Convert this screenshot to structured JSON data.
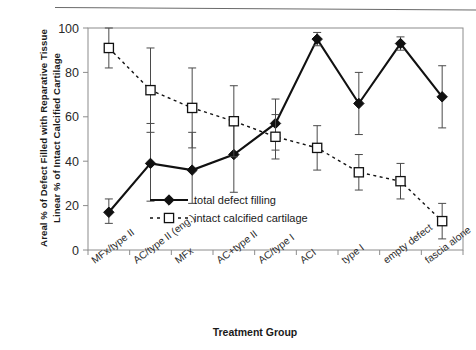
{
  "figure": {
    "background": "#ffffff",
    "frame_color": "#8c8c8c",
    "series_color": "#111111"
  },
  "axis": {
    "y_title_line1": "Areal % of Defect Filled with Reparative Tissue",
    "y_title_line2": "Linear % of Intact Calcified Cartilage",
    "x_title": "Treatment Group",
    "y_ticks": [
      "0",
      "20",
      "40",
      "60",
      "80",
      "100"
    ]
  },
  "legend": {
    "items": [
      {
        "label": "total defect filling",
        "marker": "filled-diamond",
        "line": "solid"
      },
      {
        "label": "intact calcified cartilage",
        "marker": "open-square",
        "line": "dashed"
      }
    ]
  },
  "chart_data": {
    "type": "line",
    "title": "",
    "xlabel": "Treatment Group",
    "ylabel": "Areal % of Defect Filled with Reparative Tissue / Linear % of Intact Calcified Cartilage",
    "ylim": [
      0,
      100
    ],
    "yticks": [
      0,
      20,
      40,
      60,
      80,
      100
    ],
    "grid": false,
    "legend_position": "inside-bottom-left",
    "categories": [
      "MFx/type II",
      "AC/type II (eng.)",
      "MFx",
      "AC+type II",
      "AC/type I",
      "ACI",
      "type I",
      "empty defect",
      "fascia alone"
    ],
    "series": [
      {
        "name": "total defect filling",
        "marker": "filled-diamond",
        "linestyle": "solid",
        "values": [
          17,
          39,
          36,
          43,
          57,
          95,
          66,
          93,
          69
        ],
        "error_low": [
          12,
          22,
          21,
          26,
          45,
          92,
          52,
          90,
          55
        ],
        "error_high": [
          23,
          57,
          53,
          57,
          68,
          98,
          80,
          96,
          83
        ]
      },
      {
        "name": "intact calcified cartilage",
        "marker": "open-square",
        "linestyle": "dashed",
        "values": [
          91,
          72,
          64,
          58,
          51,
          46,
          35,
          31,
          13
        ],
        "error_low": [
          82,
          53,
          46,
          42,
          41,
          36,
          27,
          23,
          5
        ],
        "error_high": [
          100,
          91,
          82,
          74,
          61,
          56,
          43,
          39,
          21
        ]
      }
    ]
  }
}
